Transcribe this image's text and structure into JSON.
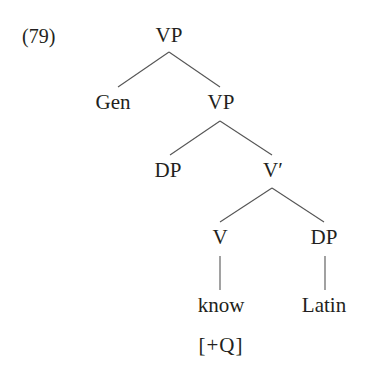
{
  "example_number": "(79)",
  "tree": {
    "root": "VP",
    "gen": "Gen",
    "vp2": "VP",
    "dp_spec": "DP",
    "vbar": "V′",
    "v": "V",
    "dp_obj": "DP",
    "know": "know",
    "latin": "Latin",
    "feature": "[+Q]"
  },
  "colors": {
    "text": "#231f20",
    "edges": "#555555",
    "background": "#ffffff"
  }
}
